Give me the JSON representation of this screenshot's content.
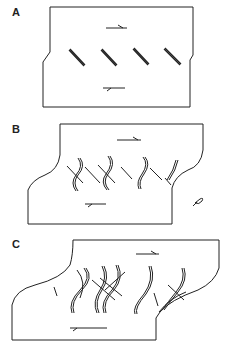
{
  "figure": {
    "panels": [
      {
        "id": "A",
        "label": "A",
        "description": "Rectangular block under dextral shear with isolated en echelon tension gashes"
      },
      {
        "id": "B",
        "label": "B",
        "description": "Progressive shear: sigmoidal tension gashes with new straight gashes"
      },
      {
        "id": "C",
        "label": "C",
        "description": "Advanced shear: multiple generations of sigmoidal gashes overprinting"
      }
    ],
    "symbols": {
      "shear_top": "arrow-right",
      "shear_bottom": "arrow-left",
      "extra_symbol_b": "sigma-clast-symbol"
    },
    "colors": {
      "line": "#222222",
      "background": "#ffffff"
    }
  }
}
